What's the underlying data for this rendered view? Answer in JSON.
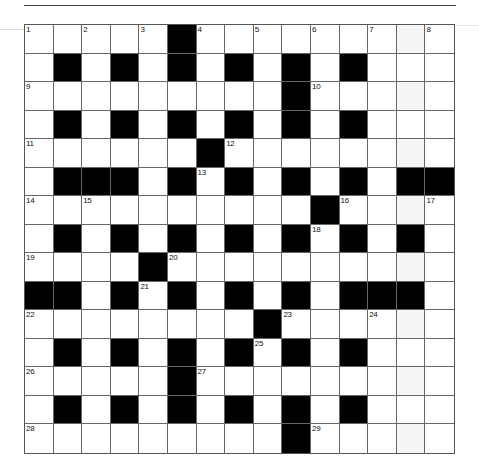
{
  "puzzle": {
    "rows": 15,
    "cols": 15,
    "grid": [
      ".....",
      "",
      "",
      "",
      "",
      "",
      "",
      "",
      "",
      "",
      "",
      "",
      "",
      "",
      ""
    ],
    "layout": [
      "WWWWWBWWWWWWWWW",
      "WBWBWBWBWBWBWWW",
      "WWWWWWWWWBWWWWW",
      "WBWBWBWBWBWBWWW",
      "WWWWWWBWWWWWWWW",
      "WBBBWBWBWBWBWBB",
      "WWWWWWWWWWBWWWW",
      "WBWBWBWBWBWBWBW",
      "WWWWBWWWWWWWWWW",
      "BBWBWBWBWBWBBBW",
      "WWWWWWWWBWWWWWW",
      "WBWBWBWBWBWBWWW",
      "WWWWWBWWWWWWWWW",
      "WBWBWBWBWBWBWWW",
      "WWWWWWWWWBWWWWW"
    ],
    "numbers": [
      {
        "r": 0,
        "c": 0,
        "n": "1"
      },
      {
        "r": 0,
        "c": 2,
        "n": "2"
      },
      {
        "r": 0,
        "c": 4,
        "n": "3"
      },
      {
        "r": 0,
        "c": 6,
        "n": "4"
      },
      {
        "r": 0,
        "c": 8,
        "n": "5"
      },
      {
        "r": 0,
        "c": 10,
        "n": "6"
      },
      {
        "r": 0,
        "c": 12,
        "n": "7"
      },
      {
        "r": 0,
        "c": 14,
        "n": "8"
      },
      {
        "r": 2,
        "c": 0,
        "n": "9"
      },
      {
        "r": 2,
        "c": 10,
        "n": "10"
      },
      {
        "r": 4,
        "c": 0,
        "n": "11"
      },
      {
        "r": 4,
        "c": 7,
        "n": "12"
      },
      {
        "r": 5,
        "c": 6,
        "n": "13"
      },
      {
        "r": 6,
        "c": 0,
        "n": "14"
      },
      {
        "r": 6,
        "c": 2,
        "n": "15"
      },
      {
        "r": 6,
        "c": 11,
        "n": "16"
      },
      {
        "r": 6,
        "c": 14,
        "n": "17"
      },
      {
        "r": 7,
        "c": 10,
        "n": "18"
      },
      {
        "r": 8,
        "c": 0,
        "n": "19"
      },
      {
        "r": 8,
        "c": 5,
        "n": "20"
      },
      {
        "r": 9,
        "c": 4,
        "n": "21"
      },
      {
        "r": 10,
        "c": 0,
        "n": "22"
      },
      {
        "r": 10,
        "c": 9,
        "n": "23"
      },
      {
        "r": 10,
        "c": 12,
        "n": "24"
      },
      {
        "r": 11,
        "c": 8,
        "n": "25"
      },
      {
        "r": 12,
        "c": 0,
        "n": "26"
      },
      {
        "r": 12,
        "c": 6,
        "n": "27"
      },
      {
        "r": 14,
        "c": 0,
        "n": "28"
      },
      {
        "r": 14,
        "c": 10,
        "n": "29"
      }
    ],
    "colors": {
      "block": "#000000",
      "cell": "#ffffff",
      "line": "#666666"
    }
  }
}
